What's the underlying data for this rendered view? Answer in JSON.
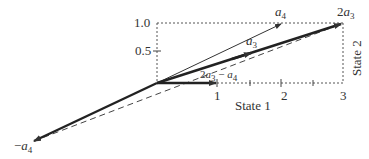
{
  "diagram": {
    "type": "vector-diagram",
    "colors": {
      "ink": "#333333",
      "background": "#ffffff"
    },
    "axes": {
      "x_label": "State 1",
      "y_label": "State 2",
      "x_ticks": [
        "1",
        "2",
        "3"
      ],
      "y_ticks": [
        "0.5",
        "1.0"
      ]
    },
    "vectors": [
      {
        "name": "a3",
        "label_base": "a",
        "label_sub": "3",
        "from": [
          0,
          0
        ],
        "to": [
          1.5,
          0.5
        ],
        "style": "thick"
      },
      {
        "name": "a4",
        "label_base": "a",
        "label_sub": "4",
        "from": [
          0,
          0
        ],
        "to": [
          2,
          1
        ],
        "style": "thin"
      },
      {
        "name": "2a3",
        "label_prefix": "2",
        "label_base": "a",
        "label_sub": "3",
        "from": [
          0,
          0
        ],
        "to": [
          3,
          1
        ],
        "style": "thick"
      },
      {
        "name": "2a3-a4",
        "label_prefix": "2",
        "label_base": "a",
        "label_sub": "3",
        "label_mid": " − ",
        "label_base2": "a",
        "label_sub2": "4",
        "from": [
          0,
          0
        ],
        "to": [
          1,
          0
        ],
        "style": "thick"
      },
      {
        "name": "-a4",
        "label_prefix": "−",
        "label_base": "a",
        "label_sub": "4",
        "from": [
          0,
          0
        ],
        "to": [
          -2,
          -1
        ],
        "style": "thick"
      }
    ],
    "dashed_segments": [
      {
        "from": [
          -2,
          -1
        ],
        "to": [
          3,
          1
        ]
      },
      {
        "from": [
          0,
          1
        ],
        "to": [
          3,
          1
        ]
      },
      {
        "from": [
          3,
          1
        ],
        "to": [
          3,
          0
        ]
      },
      {
        "from": [
          0,
          0
        ],
        "to": [
          3,
          0
        ]
      },
      {
        "from": [
          0,
          0
        ],
        "to": [
          0,
          1
        ]
      }
    ]
  }
}
